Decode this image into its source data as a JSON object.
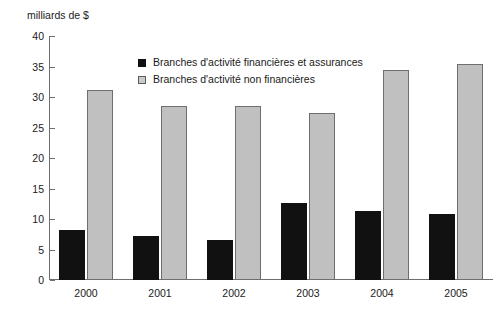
{
  "chart_data": {
    "type": "bar",
    "title": "",
    "subtitle": "",
    "xlabel": "",
    "ylabel": "milliards de $",
    "ylim": [
      0,
      40
    ],
    "ytick_step": 5,
    "yticks": [
      0,
      5,
      10,
      15,
      20,
      25,
      30,
      35,
      40
    ],
    "ytick_labels": [
      "0",
      "5",
      "10",
      "15",
      "20",
      "25",
      "30",
      "35",
      "40"
    ],
    "grid": false,
    "legend_position": "top-center",
    "categories": [
      "2000",
      "2001",
      "2002",
      "2003",
      "2004",
      "2005"
    ],
    "series": [
      {
        "name": "Branches d'activité financières et assurances",
        "color": "#111111",
        "values": [
          8.2,
          7.2,
          6.6,
          12.7,
          11.3,
          10.9
        ]
      },
      {
        "name": "Branches d'activité non financières",
        "color": "#c0c0c0",
        "values": [
          31.1,
          28.5,
          28.5,
          27.3,
          34.4,
          35.4
        ]
      }
    ]
  }
}
